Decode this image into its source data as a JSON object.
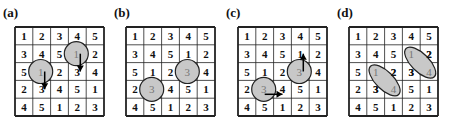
{
  "figure": {
    "grid": [
      [
        1,
        2,
        3,
        4,
        5
      ],
      [
        3,
        4,
        5,
        1,
        2
      ],
      [
        5,
        1,
        2,
        3,
        4
      ],
      [
        2,
        3,
        4,
        5,
        1
      ],
      [
        4,
        5,
        1,
        2,
        3
      ]
    ],
    "colors": {
      "line": "#222222",
      "highlight_fill": "#c8c8c8",
      "highlight_stroke": "#222222",
      "highlight_text": "#777777",
      "text": "#111111"
    },
    "panels": [
      {
        "label": "(a)",
        "left": 2,
        "grid_left": 15,
        "highlights": [
          {
            "shape": "circle",
            "row": 2,
            "col": 1,
            "text": "1"
          },
          {
            "shape": "circle",
            "row": 1,
            "col": 3,
            "text": "1"
          }
        ],
        "arrows": [
          {
            "from": [
              2,
              1
            ],
            "to": [
              3,
              1
            ],
            "dir": "down"
          },
          {
            "from": [
              1,
              3
            ],
            "to": [
              2,
              3
            ],
            "dir": "down"
          }
        ]
      },
      {
        "label": "(b)",
        "left": 113,
        "grid_left": 126,
        "highlights": [
          {
            "shape": "circle",
            "row": 3,
            "col": 1,
            "text": "3"
          },
          {
            "shape": "circle",
            "row": 2,
            "col": 3,
            "text": "3"
          }
        ],
        "arrows": []
      },
      {
        "label": "(c)",
        "left": 225,
        "grid_left": 238,
        "highlights": [
          {
            "shape": "circle",
            "row": 3,
            "col": 1,
            "text": "3"
          },
          {
            "shape": "circle",
            "row": 2,
            "col": 3,
            "text": "3"
          }
        ],
        "arrows": [
          {
            "from": [
              3,
              1
            ],
            "to": [
              3,
              2
            ],
            "dir": "right"
          },
          {
            "from": [
              2,
              3
            ],
            "to": [
              1,
              3
            ],
            "dir": "up"
          }
        ]
      },
      {
        "label": "(d)",
        "left": 336,
        "grid_left": 349,
        "highlights": [
          {
            "shape": "ellipse",
            "from": [
              2,
              1
            ],
            "to": [
              3,
              2
            ],
            "texts": [
              "1",
              "4"
            ]
          },
          {
            "shape": "ellipse",
            "from": [
              1,
              3
            ],
            "to": [
              2,
              4
            ],
            "texts": [
              "1",
              "4"
            ]
          }
        ],
        "arrows": []
      }
    ]
  }
}
